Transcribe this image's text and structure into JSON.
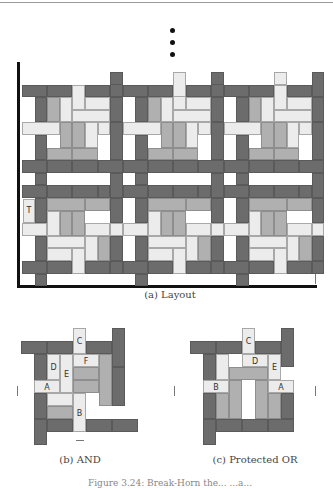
{
  "captions": {
    "layout": "(a) Layout",
    "and": "(b) AND",
    "or": "(c) Protected OR",
    "figure": "Figure 3.24: Break-Horn the...  ...a..."
  },
  "layout_label": "T",
  "and_labels": {
    "A": "A",
    "B": "B",
    "C": "C",
    "D": "D",
    "E": "E",
    "F": "F"
  },
  "or_labels": {
    "A": "A",
    "B": "B",
    "C": "C",
    "D": "D",
    "E": "E"
  },
  "layout": {
    "unit": 12.6,
    "x0": 22,
    "y0": 72,
    "tile_w": 8,
    "upper_tile": [
      [
        "dk",
        0,
        1,
        2,
        1
      ],
      [
        "dk",
        2,
        1,
        2,
        1
      ],
      [
        "lt",
        4,
        1,
        1,
        2
      ],
      [
        "dk",
        5,
        1,
        2,
        1
      ],
      [
        "dk",
        7,
        0,
        1,
        2
      ],
      [
        "dk",
        1,
        2,
        1,
        2
      ],
      [
        "md",
        2,
        2,
        1,
        2
      ],
      [
        "lt",
        3,
        2,
        1,
        2
      ],
      [
        "lt",
        5,
        2,
        2,
        1
      ],
      [
        "dk",
        7,
        2,
        1,
        2
      ],
      [
        "lt",
        4,
        3,
        3,
        1
      ],
      [
        "lt",
        0,
        4,
        3,
        1
      ],
      [
        "md",
        3,
        4,
        1,
        2
      ],
      [
        "md",
        4,
        4,
        1,
        2
      ],
      [
        "lt",
        5,
        4,
        1,
        2
      ],
      [
        "lt",
        6,
        4,
        1,
        1
      ],
      [
        "dk",
        1,
        5,
        1,
        2
      ],
      [
        "dk",
        7,
        4,
        1,
        3
      ],
      [
        "md",
        2,
        6,
        2,
        1
      ],
      [
        "md",
        4,
        6,
        2,
        1
      ],
      [
        "dk",
        0,
        7,
        2,
        1
      ],
      [
        "dk",
        2,
        7,
        2,
        1
      ],
      [
        "dk",
        4,
        7,
        2,
        1
      ],
      [
        "dk",
        6,
        7,
        2,
        1
      ],
      [
        "dk",
        1,
        8,
        1,
        1
      ],
      [
        "dk",
        7,
        8,
        1,
        1
      ]
    ],
    "lower_tile": [
      [
        "dk",
        0,
        9,
        2,
        1
      ],
      [
        "dk",
        2,
        9,
        2,
        1
      ],
      [
        "dk",
        4,
        9,
        2,
        1
      ],
      [
        "dk",
        7,
        8,
        1,
        2
      ],
      [
        "dk",
        6,
        9,
        1,
        1
      ],
      [
        "dk",
        1,
        10,
        1,
        2
      ],
      [
        "md",
        2,
        10,
        3,
        1
      ],
      [
        "md",
        5,
        10,
        2,
        1
      ],
      [
        "dk",
        7,
        10,
        1,
        2
      ],
      [
        "lt",
        2,
        11,
        1,
        2
      ],
      [
        "md",
        3,
        11,
        1,
        2
      ],
      [
        "md",
        4,
        11,
        1,
        2
      ],
      [
        "lt",
        0,
        12,
        2,
        1
      ],
      [
        "lt",
        5,
        12,
        2,
        1
      ],
      [
        "lt",
        7,
        12,
        1,
        1
      ],
      [
        "dk",
        1,
        13,
        1,
        2
      ],
      [
        "lt",
        2,
        13,
        3,
        1
      ],
      [
        "lt",
        5,
        13,
        1,
        2
      ],
      [
        "md",
        6,
        13,
        1,
        2
      ],
      [
        "dk",
        7,
        13,
        1,
        2
      ],
      [
        "lt",
        2,
        14,
        2,
        1
      ],
      [
        "lt",
        4,
        14,
        1,
        2
      ],
      [
        "dk",
        0,
        15,
        2,
        1
      ],
      [
        "dk",
        2,
        15,
        2,
        1
      ],
      [
        "dk",
        5,
        15,
        2,
        1
      ],
      [
        "dk",
        7,
        15,
        1,
        1
      ],
      [
        "dk",
        1,
        16,
        1,
        1
      ]
    ],
    "extra": [
      [
        "lt",
        12,
        0,
        1,
        2
      ],
      [
        "dk",
        7,
        0,
        1,
        1
      ],
      [
        "dk",
        15,
        0,
        1,
        1
      ],
      [
        "lt",
        20,
        0,
        1,
        1
      ]
    ]
  },
  "and_gate": {
    "unit": 13,
    "x0": 21,
    "y0": 328,
    "rects": [
      [
        "lt",
        4,
        0,
        1,
        2,
        "C"
      ],
      [
        "dk",
        0,
        1,
        2,
        1
      ],
      [
        "dk",
        2,
        1,
        2,
        1
      ],
      [
        "dk",
        5,
        1,
        2,
        1
      ],
      [
        "dk",
        7,
        0,
        1,
        3
      ],
      [
        "dk",
        1,
        2,
        1,
        3
      ],
      [
        "lt",
        2,
        2,
        1,
        2,
        "D"
      ],
      [
        "lt",
        3,
        2,
        1,
        3,
        "E"
      ],
      [
        "lt",
        4,
        2,
        2,
        1,
        "F"
      ],
      [
        "md",
        6,
        2,
        1,
        4
      ],
      [
        "md",
        4,
        3,
        2,
        1
      ],
      [
        "md",
        4,
        4,
        2,
        1
      ],
      [
        "lt",
        1,
        4,
        2,
        1,
        "A"
      ],
      [
        "dk",
        7,
        3,
        1,
        3
      ],
      [
        "dk",
        1,
        5,
        1,
        2
      ],
      [
        "lt",
        2,
        5,
        2,
        1
      ],
      [
        "lt",
        4,
        5,
        1,
        3,
        "B"
      ],
      [
        "md",
        2,
        6,
        2,
        1
      ],
      [
        "dk",
        1,
        7,
        1,
        2
      ],
      [
        "dk",
        2,
        7,
        2,
        1
      ],
      [
        "dk",
        5,
        7,
        2,
        1
      ],
      [
        "dk",
        7,
        7,
        2,
        1
      ]
    ],
    "ticks": [
      [
        17,
        386,
        1,
        10
      ],
      [
        76,
        440,
        8,
        1
      ]
    ]
  },
  "or_gate": {
    "unit": 13,
    "x0": 190,
    "y0": 328,
    "rects": [
      [
        "lt",
        4,
        0,
        1,
        2,
        "C"
      ],
      [
        "dk",
        0,
        1,
        2,
        1
      ],
      [
        "dk",
        2,
        1,
        2,
        1
      ],
      [
        "dk",
        5,
        1,
        2,
        1
      ],
      [
        "dk",
        7,
        0,
        1,
        3
      ],
      [
        "dk",
        1,
        2,
        1,
        3
      ],
      [
        "lt",
        2,
        2,
        1,
        2
      ],
      [
        "lt",
        4,
        2,
        2,
        1,
        "D"
      ],
      [
        "lt",
        6,
        2,
        1,
        2,
        "E"
      ],
      [
        "md",
        3,
        3,
        3,
        1
      ],
      [
        "lt",
        1,
        4,
        2,
        1,
        "B"
      ],
      [
        "lt",
        6,
        4,
        2,
        1,
        "A"
      ],
      [
        "md",
        3,
        4,
        1,
        3
      ],
      [
        "md",
        5,
        4,
        1,
        3
      ],
      [
        "dk",
        1,
        5,
        1,
        2
      ],
      [
        "md",
        2,
        5,
        1,
        2
      ],
      [
        "md",
        6,
        5,
        1,
        2
      ],
      [
        "dk",
        7,
        5,
        1,
        2
      ],
      [
        "dk",
        1,
        7,
        1,
        2
      ],
      [
        "dk",
        2,
        7,
        2,
        1
      ],
      [
        "dk",
        4,
        7,
        2,
        1
      ],
      [
        "dk",
        6,
        7,
        2,
        1
      ]
    ],
    "ticks": [
      [
        174,
        386,
        1,
        10
      ],
      [
        315,
        386,
        1,
        10
      ]
    ]
  }
}
